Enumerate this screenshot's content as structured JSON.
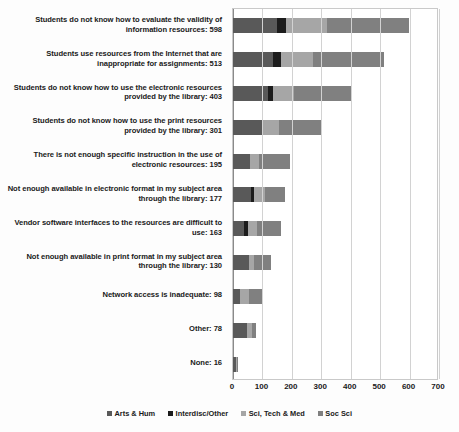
{
  "chart_data": {
    "type": "bar",
    "orientation": "horizontal",
    "stacked": true,
    "title": "",
    "subtitle": "",
    "xlabel": "",
    "ylabel": "",
    "xlim": [
      0,
      700
    ],
    "xticks": [
      0,
      100,
      200,
      300,
      400,
      500,
      600,
      700
    ],
    "grid": true,
    "legend_position": "bottom",
    "categories": [
      "Students do not know how to evaluate the validity of information resources: 598",
      "Students use resources from the Internet that are inappropriate for assignments: 513",
      "Students do not know how to use the electronic resources provided by the library: 403",
      "Students do not know how to use the print resources provided by the library: 301",
      "There is not enough specific instruction in the use of electronic resources: 195",
      "Not enough available in electronic format in my subject area through the library: 177",
      "Vendor software interfaces to the resources are difficult to use: 163",
      "Not enough available in print format in my subject area through the library: 130",
      "Network access is inadequate: 98",
      "Other: 78",
      "None: 16"
    ],
    "totals": [
      598,
      513,
      403,
      301,
      195,
      177,
      163,
      130,
      98,
      78,
      16
    ],
    "series": [
      {
        "name": "Arts & Hum",
        "color": "#595959",
        "values": [
          148,
          136,
          119,
          100,
          58,
          60,
          38,
          53,
          25,
          48,
          10
        ]
      },
      {
        "name": "Interdisc/Other",
        "color": "#1c1c1c",
        "values": [
          33,
          28,
          17,
          0,
          0,
          10,
          12,
          0,
          0,
          0,
          0
        ]
      },
      {
        "name": "Sci, Tech & Med",
        "color": "#a6a6a6",
        "values": [
          137,
          108,
          70,
          57,
          30,
          38,
          33,
          20,
          28,
          18,
          3
        ]
      },
      {
        "name": "Soc Sci",
        "color": "#808080",
        "values": [
          280,
          241,
          197,
          144,
          107,
          69,
          80,
          57,
          45,
          12,
          3
        ]
      }
    ]
  }
}
